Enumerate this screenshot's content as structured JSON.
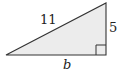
{
  "diagram": {
    "type": "right-triangle",
    "hypotenuse_label": "11",
    "vertical_leg_label": "5",
    "base_label": "b",
    "right_angle_marker": true,
    "fill_color": "#ececec",
    "stroke_color": "#333333"
  }
}
